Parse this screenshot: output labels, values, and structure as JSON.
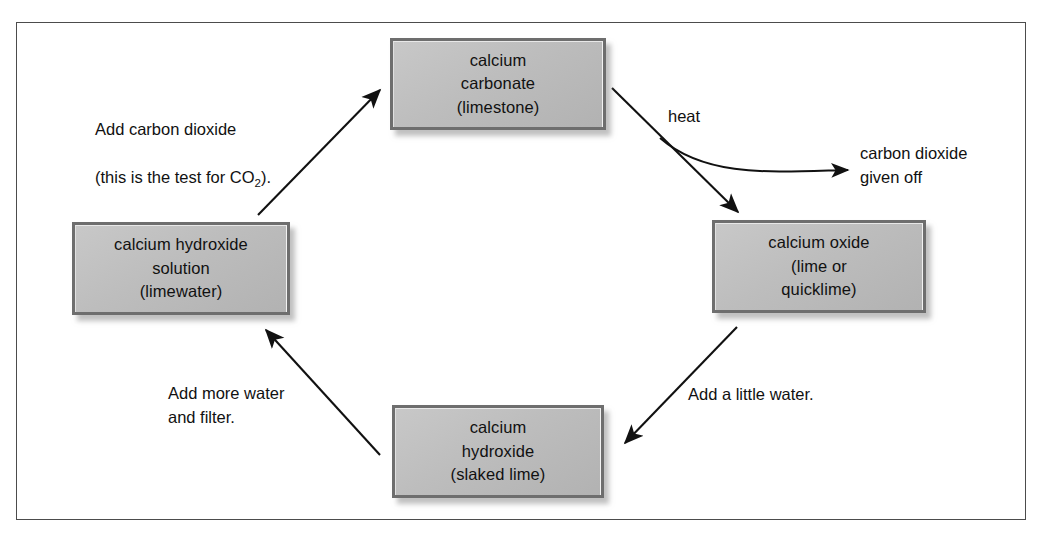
{
  "diagram": {
    "nodes": [
      {
        "id": "carbonate",
        "label": "calcium\ncarbonate\n(limestone)"
      },
      {
        "id": "oxide",
        "label": "calcium oxide\n(lime or\nquicklime)"
      },
      {
        "id": "hydroxide",
        "label": "calcium\nhydroxide\n(slaked lime)"
      },
      {
        "id": "limewater",
        "label": "calcium hydroxide\nsolution\n(limewater)"
      }
    ],
    "captions": {
      "add_carbon_dioxide_line1": "Add carbon dioxide",
      "add_carbon_dioxide_line2_a": "(this is the test for CO",
      "add_carbon_dioxide_line2_sub": "2",
      "add_carbon_dioxide_line2_b": ").",
      "heat": "heat",
      "carbon_dioxide_given_off": "carbon dioxide\ngiven off",
      "add_a_little_water": "Add a little water.",
      "add_more_water_and_filter": "Add more water\nand filter."
    },
    "colors": {
      "box_fill_light": "#c8c8c8",
      "box_fill_dark": "#b2b2b2",
      "box_border": "#6e6e6e",
      "frame_border": "#4c4c4c",
      "text": "#111111",
      "arrow": "#111111",
      "page_background": "#ffffff"
    },
    "arrows": [
      {
        "id": "limewater-to-carbonate",
        "from": "limewater",
        "to": "carbonate",
        "label": "Add carbon dioxide (this is the test for CO2).",
        "style": "straight"
      },
      {
        "id": "carbonate-to-oxide",
        "from": "carbonate",
        "to": "oxide",
        "label": "heat",
        "style": "straight"
      },
      {
        "id": "carbonate-to-co2",
        "from": "carbonate",
        "to": "carbon dioxide given off",
        "label": "heat",
        "style": "curved"
      },
      {
        "id": "oxide-to-hydroxide",
        "from": "oxide",
        "to": "hydroxide",
        "label": "Add a little water.",
        "style": "straight"
      },
      {
        "id": "hydroxide-to-limewater",
        "from": "hydroxide",
        "to": "limewater",
        "label": "Add more water and filter.",
        "style": "straight"
      }
    ]
  }
}
